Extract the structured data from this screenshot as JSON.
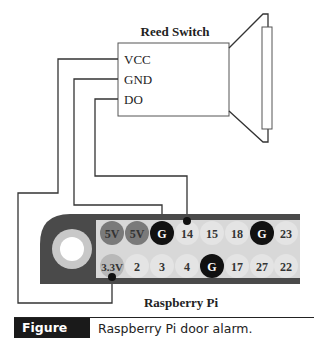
{
  "reed_switch": {
    "title": "Reed Switch",
    "pins": [
      "VCC",
      "GND",
      "DO"
    ]
  },
  "raspberry_pi": {
    "title": "Raspberry Pi",
    "header_top_row": [
      {
        "label": "5V",
        "type": "power5v"
      },
      {
        "label": "5V",
        "type": "power5v"
      },
      {
        "label": "G",
        "type": "ground"
      },
      {
        "label": "14",
        "type": "gpio"
      },
      {
        "label": "15",
        "type": "gpio"
      },
      {
        "label": "18",
        "type": "gpio"
      },
      {
        "label": "G",
        "type": "ground"
      },
      {
        "label": "23",
        "type": "gpio"
      }
    ],
    "header_bottom_row": [
      {
        "label": "3.3V",
        "type": "power33"
      },
      {
        "label": "2",
        "type": "gpio"
      },
      {
        "label": "3",
        "type": "gpio"
      },
      {
        "label": "4",
        "type": "gpio"
      },
      {
        "label": "G",
        "type": "ground"
      },
      {
        "label": "17",
        "type": "gpio"
      },
      {
        "label": "27",
        "type": "gpio"
      },
      {
        "label": "22",
        "type": "gpio"
      }
    ]
  },
  "connections": [
    {
      "from": "VCC",
      "to": "3.3V"
    },
    {
      "from": "GND",
      "to": "G"
    },
    {
      "from": "DO",
      "to": "14"
    }
  ],
  "colors": {
    "board": "#4a4a4a",
    "pin_area": "#d8d8d8",
    "power5v": "#7a7a7a",
    "ground": "#111111",
    "power33": "#b8b8b8",
    "gpio": "#e4e4e4",
    "wire": "#333333"
  },
  "caption": {
    "label": "Figure 5-5",
    "text": "Raspberry Pi door alarm."
  }
}
